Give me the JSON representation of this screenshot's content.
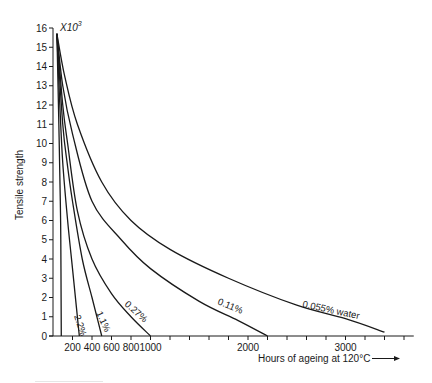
{
  "chart_data": {
    "type": "line",
    "title": "",
    "xlabel": "Hours of ageing at 120°C",
    "ylabel": "Tensile strength",
    "y_multiplier_label": "X10³",
    "xlim": [
      0,
      3700
    ],
    "ylim": [
      0,
      16
    ],
    "x_ticks_labeled": [
      200,
      400,
      600,
      800,
      1000,
      2000,
      3000
    ],
    "x_tick_step": 200,
    "y_ticks": [
      0,
      1,
      2,
      3,
      4,
      5,
      6,
      7,
      8,
      9,
      10,
      11,
      12,
      13,
      14,
      15,
      16
    ],
    "grid": false,
    "legend": "inline labels on curves",
    "series": [
      {
        "name": "",
        "label": "",
        "points": [
          [
            40,
            15.7
          ],
          [
            60,
            11
          ],
          [
            75,
            7
          ],
          [
            80,
            5
          ],
          [
            83,
            2
          ],
          [
            85,
            0
          ]
        ]
      },
      {
        "name": "2.2%",
        "label": "2.2%",
        "points": [
          [
            40,
            15.7
          ],
          [
            70,
            12
          ],
          [
            100,
            9
          ],
          [
            150,
            6
          ],
          [
            200,
            3.5
          ],
          [
            240,
            1.5
          ],
          [
            270,
            0
          ]
        ]
      },
      {
        "name": "1.1%",
        "label": "1.1%",
        "points": [
          [
            40,
            15.7
          ],
          [
            100,
            11
          ],
          [
            150,
            8.8
          ],
          [
            200,
            7
          ],
          [
            300,
            4
          ],
          [
            400,
            2
          ],
          [
            460,
            0.8
          ],
          [
            500,
            0
          ]
        ]
      },
      {
        "name": "0.27%",
        "label": "0.27%",
        "points": [
          [
            40,
            15.7
          ],
          [
            100,
            12
          ],
          [
            150,
            10
          ],
          [
            250,
            6.5
          ],
          [
            400,
            4
          ],
          [
            600,
            2.2
          ],
          [
            800,
            1
          ],
          [
            1000,
            0
          ]
        ]
      },
      {
        "name": "0.11%",
        "label": "0.11%",
        "points": [
          [
            40,
            15.7
          ],
          [
            100,
            13
          ],
          [
            200,
            10.5
          ],
          [
            400,
            7
          ],
          [
            700,
            5
          ],
          [
            1000,
            3.5
          ],
          [
            1500,
            1.8
          ],
          [
            1900,
            0.8
          ],
          [
            2200,
            0
          ]
        ]
      },
      {
        "name": "0.055% water",
        "label": "0.055% water",
        "points": [
          [
            40,
            15.7
          ],
          [
            120,
            13.5
          ],
          [
            250,
            11
          ],
          [
            500,
            8
          ],
          [
            800,
            6
          ],
          [
            1200,
            4.5
          ],
          [
            1800,
            3
          ],
          [
            2500,
            1.6
          ],
          [
            3000,
            0.9
          ],
          [
            3400,
            0.2
          ]
        ]
      }
    ]
  },
  "labels": {
    "ylabel": "Tensile strength",
    "xlabel": "Hours of ageing at 120°C",
    "multiplier": "X10",
    "multiplier_exp": "3",
    "arrow": "⟶",
    "curve_labels": [
      "2.2%",
      "1.1%",
      "0.27%",
      "0.11%",
      "0.055% water"
    ]
  }
}
